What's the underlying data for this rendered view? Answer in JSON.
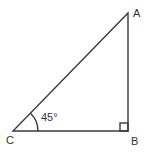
{
  "figure": {
    "type": "right-triangle",
    "background_color": "#ffffff",
    "stroke_color": "#3a3a3a",
    "labels": {
      "top_right": "A",
      "bottom_right": "B",
      "bottom_left": "C"
    },
    "angle_label": "45°",
    "right_angle_at": "B",
    "angle_at": "C"
  }
}
